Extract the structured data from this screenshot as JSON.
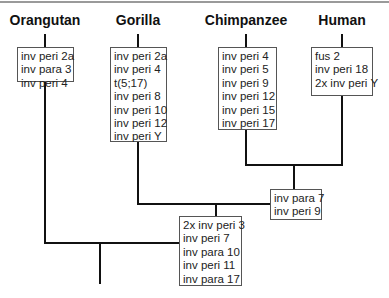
{
  "diagram": {
    "type": "phylogenetic-tree",
    "taxa": [
      {
        "name": "Orangutan",
        "events": [
          "inv peri 2a",
          "inv para 3",
          "inv peri 4"
        ]
      },
      {
        "name": "Gorilla",
        "events": [
          "inv peri 2a",
          "inv peri 4",
          "t(5;17)",
          "inv peri 8",
          "inv peri 10",
          "inv peri 12",
          "inv peri Y"
        ]
      },
      {
        "name": "Chimpanzee",
        "events": [
          "inv peri 4",
          "inv peri 5",
          "inv peri 9",
          "inv peri 12",
          "inv peri 15",
          "inv peri 17"
        ]
      },
      {
        "name": "Human",
        "events": [
          "fus 2",
          "inv peri 18",
          "2x inv peri Y"
        ]
      }
    ],
    "internal_nodes": [
      {
        "id": "chimp-human",
        "events": [
          "inv para 7",
          "inv peri 9"
        ]
      },
      {
        "id": "african-apes",
        "events": [
          "2x inv peri 3",
          "inv peri 7",
          "inv para 10",
          "inv peri 11",
          "inv para 17"
        ]
      }
    ]
  }
}
